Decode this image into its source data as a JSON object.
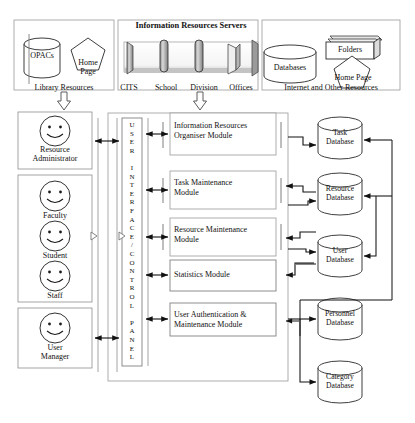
{
  "diagram": {
    "top_band": {
      "library": {
        "opacs_label": "OPACs",
        "home_page_label": "Home\nPage",
        "home_page_line1": "Home",
        "home_page_line2": "Page",
        "caption": "Library Resources"
      },
      "servers": {
        "heading": "Information Resources Servers",
        "captions": [
          "CITS",
          "School",
          "Division",
          "Offices"
        ]
      },
      "internet": {
        "databases_label": "Databases",
        "folders_label": "Folders",
        "home_page_label": "Home Page",
        "caption": "Internet and Other Resources"
      }
    },
    "actors": [
      {
        "name": "Resource Administrator",
        "line1": "Resource",
        "line2": "Administrator",
        "icon": "smiley-face-icon"
      },
      {
        "name": "Faculty",
        "line1": "Faculty",
        "line2": "",
        "icon": "smiley-face-icon"
      },
      {
        "name": "Student",
        "line1": "Student",
        "line2": "",
        "icon": "smiley-face-icon"
      },
      {
        "name": "Staff",
        "line1": "Staff",
        "line2": "",
        "icon": "smiley-face-icon"
      },
      {
        "name": "User Manager",
        "line1": "User",
        "line2": "Manager",
        "icon": "smiley-face-icon"
      }
    ],
    "control_panel": {
      "label": "USER INTERFACE / CONTROL PANEL",
      "chars": [
        "U",
        "S",
        "E",
        "R",
        "",
        "I",
        "N",
        "T",
        "E",
        "R",
        "F",
        "A",
        "C",
        "E",
        "/",
        "C",
        "O",
        "N",
        "T",
        "R",
        "O",
        "L",
        "",
        "P",
        "A",
        "N",
        "E",
        "L"
      ]
    },
    "modules": [
      {
        "name": "Information Resources Organiser Module",
        "line1": "Information Resources",
        "line2": "Organiser Module"
      },
      {
        "name": "Task Maintenance Module",
        "line1": "Task Maintenance",
        "line2": "Module"
      },
      {
        "name": "Resource Maintenance Module",
        "line1": "Resource Maintenance",
        "line2": "Module"
      },
      {
        "name": "Statistics Module",
        "line1": "Statistics Module",
        "line2": ""
      },
      {
        "name": "User Authentication & Maintenance Module",
        "line1": "User Authentication &",
        "line2": "Maintenance Module"
      }
    ],
    "databases": [
      {
        "name": "Task Database",
        "line1": "Task",
        "line2": "Database"
      },
      {
        "name": "Resource Database",
        "line1": "Resource",
        "line2": "Database"
      },
      {
        "name": "User Database",
        "line1": "User",
        "line2": "Database"
      },
      {
        "name": "Personnel Database",
        "line1": "Personnel",
        "line2": "Database"
      },
      {
        "name": "Category Database",
        "line1": "Category",
        "line2": "Database"
      }
    ],
    "colors": {
      "stroke": "#1a1a1a",
      "fill": "#ffffff",
      "shade": "#b9b9b9",
      "light_shade": "#d8d8d8",
      "frame": "#9a9a9a"
    }
  }
}
